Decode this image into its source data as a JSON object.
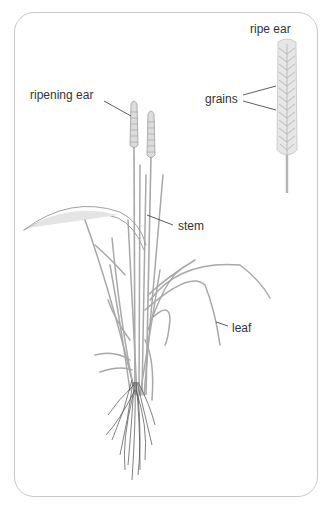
{
  "diagram": {
    "labels": {
      "ripe_ear": "ripe ear",
      "grains": "grains",
      "ripening_ear": "ripening ear",
      "stem": "stem",
      "leaf": "leaf"
    },
    "colors": {
      "frame": "#c9c9c9",
      "plant": "#a8a8a8",
      "plant_dark": "#8a8a8a",
      "roots": "#4a4a4a",
      "leader_line": "#333333",
      "text": "#333333"
    }
  }
}
